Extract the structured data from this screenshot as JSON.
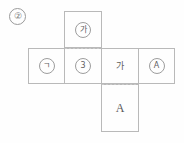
{
  "question": {
    "number_label": "②"
  },
  "diagram": {
    "kind": "cube-net",
    "description_label": "cube net cross layout",
    "cells": [
      {
        "id": "top",
        "position": "top",
        "label": "가",
        "style": "circled",
        "row": 0,
        "col": 1
      },
      {
        "id": "left",
        "position": "middle-1",
        "label": "ㄱ",
        "style": "circled",
        "row": 1,
        "col": 0
      },
      {
        "id": "center-left",
        "position": "middle-2",
        "label": "3",
        "style": "circled",
        "row": 1,
        "col": 1
      },
      {
        "id": "center-right",
        "position": "middle-3",
        "label": "가",
        "style": "bare",
        "row": 1,
        "col": 2
      },
      {
        "id": "right",
        "position": "middle-4",
        "label": "A",
        "style": "circled",
        "row": 1,
        "col": 3
      },
      {
        "id": "bottom",
        "position": "bottom",
        "label": "A",
        "style": "plain",
        "row": 2,
        "col": 2
      }
    ]
  },
  "colors": {
    "background": "#fefefe",
    "stroke": "#b9b9b9",
    "fold_stroke": "#c9c9c9",
    "text": "#5f5f5f"
  }
}
